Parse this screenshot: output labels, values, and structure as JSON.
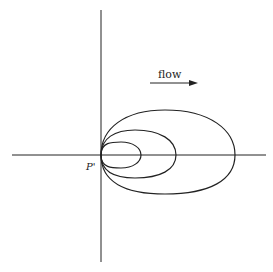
{
  "diagram": {
    "point_label": "P'",
    "flow_label": "flow",
    "stroke_color": "#222222",
    "background": "#ffffff",
    "loops": [
      {
        "name": "small",
        "right_x": 141,
        "half_height": 13
      },
      {
        "name": "medium",
        "right_x": 176,
        "half_height": 25
      },
      {
        "name": "large",
        "right_x": 235,
        "half_height": 40
      }
    ]
  }
}
